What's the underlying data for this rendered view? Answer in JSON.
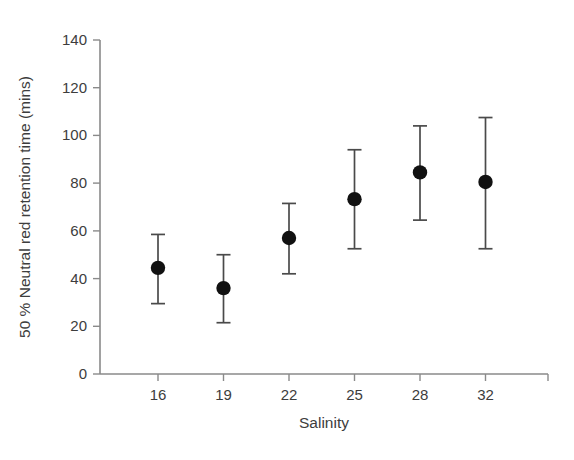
{
  "chart_data": {
    "type": "scatter",
    "title": "",
    "xlabel": "Salinity",
    "ylabel": "50 % Neutral red retention time (mins)",
    "categories": [
      "16",
      "19",
      "22",
      "25",
      "28",
      "32"
    ],
    "x": [
      16,
      19,
      22,
      25,
      28,
      32
    ],
    "values": [
      44.5,
      36,
      57,
      73.3,
      84.5,
      80.5
    ],
    "error_upper": [
      58.5,
      50,
      71.5,
      94,
      104,
      107.5
    ],
    "error_lower": [
      29.5,
      21.5,
      42,
      52.5,
      64.5,
      52.5
    ],
    "error_bars": "asymmetric-range",
    "xticklabels": [
      "16",
      "19",
      "22",
      "25",
      "28",
      "32"
    ],
    "yticks": [
      0,
      20,
      40,
      60,
      80,
      100,
      120,
      140
    ],
    "yticklabels": [
      "0",
      "20",
      "40",
      "60",
      "80",
      "100",
      "120",
      "140"
    ],
    "ylim": [
      0,
      140
    ],
    "grid": false,
    "legend": "none",
    "marker": "filled-circle",
    "marker_color": "#111111",
    "axis_color": "#8a8a8a",
    "text_color": "#3d3d3d",
    "background_color": "#ffffff"
  }
}
